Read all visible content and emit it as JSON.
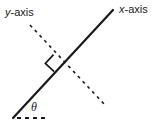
{
  "figure": {
    "type": "geometry-diagram",
    "width": 156,
    "height": 124,
    "background_color": "#ffffff",
    "stroke_color": "#1a1a1a",
    "labels": {
      "y_axis": {
        "variable": "y",
        "suffix": "-axis"
      },
      "x_axis": {
        "variable": "x",
        "suffix": "-axis"
      },
      "angle": "θ"
    },
    "elements": {
      "x_axis_line": {
        "name": "x-axis",
        "style": "solid",
        "x1": 13,
        "y1": 118,
        "x2": 113,
        "y2": 10,
        "stroke_width": 2.2
      },
      "y_axis_line": {
        "name": "y-axis",
        "style": "dashed",
        "x1": 30,
        "y1": 25,
        "x2": 105,
        "y2": 105,
        "stroke_width": 1.6,
        "dash_pattern": "3 4"
      },
      "horizontal_reference": {
        "name": "horizontal-reference-ray",
        "style": "dashed",
        "x1": 17,
        "y1": 118,
        "x2": 49,
        "y2": 118,
        "stroke_width": 1.6,
        "dash_pattern": "4 4"
      },
      "right_angle_marker": {
        "name": "right-angle-marker",
        "vertex_x": 63,
        "vertex_y": 62,
        "size": 11,
        "stroke_width": 1.6
      },
      "vertex": {
        "name": "angle-vertex",
        "x": 13,
        "y": 118
      }
    }
  }
}
